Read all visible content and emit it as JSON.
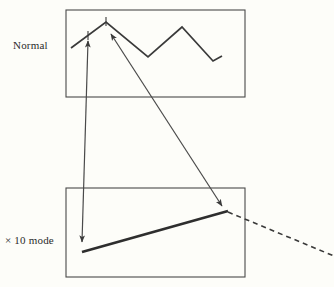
{
  "figure": {
    "title": "",
    "background_color": "#fdfdf9",
    "stroke_color": "#3a3a3a",
    "labels": {
      "normal": "Normal",
      "x10_mode": "× 10 mode"
    },
    "panels": [
      {
        "id": "normal-panel",
        "name": "normal-signal-panel",
        "label": "Normal",
        "box": {
          "x": 66,
          "y": 10,
          "width": 179,
          "height": 87
        },
        "trace": {
          "name": "normal-waveform",
          "type": "polyline",
          "points": "71,48 106,22 148,57 182,27 213,61 222,56",
          "stroke_width": 1.6
        }
      },
      {
        "id": "x10-panel",
        "name": "x10-mode-panel",
        "label": "× 10 mode",
        "box": {
          "x": 66,
          "y": 188,
          "width": 179,
          "height": 89
        },
        "trace": {
          "name": "x10-expanded-trace",
          "type": "line",
          "points": "82,252 228,211",
          "stroke_width": 2.6
        },
        "continuation": {
          "name": "x10-dashed-continuation",
          "type": "dashed-line",
          "points": "228,212 334,255",
          "stroke_width": 1.6,
          "dash": "5 4"
        }
      }
    ],
    "annotations": [
      {
        "id": "arrow-vertical",
        "name": "vertical-double-arrow",
        "type": "double-headed-arrow",
        "from": {
          "x": 88,
          "y": 40
        },
        "to": {
          "x": 82,
          "y": 243
        },
        "description": "links left tick on normal trace to start of x10 trace"
      },
      {
        "id": "arrow-diagonal",
        "name": "diagonal-double-arrow",
        "type": "double-headed-arrow",
        "from": {
          "x": 110,
          "y": 33
        },
        "to": {
          "x": 223,
          "y": 207
        },
        "description": "links peak tick on normal trace to end of x10 trace"
      }
    ],
    "ticks": [
      {
        "name": "tick-mark-left",
        "x": 88,
        "y": 34,
        "height": 9
      },
      {
        "name": "tick-mark-peak",
        "x": 106,
        "y": 18,
        "height": 9
      }
    ]
  }
}
